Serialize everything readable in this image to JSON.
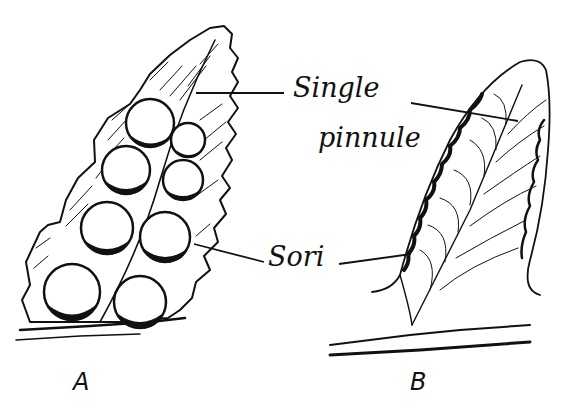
{
  "figure": {
    "type": "botanical line drawing",
    "panels": [
      {
        "id": "A",
        "label": "A",
        "description": "Pinnule underside with round sori"
      },
      {
        "id": "B",
        "label": "B",
        "description": "Single pinnule with marginal sori"
      }
    ],
    "annotations": {
      "single": "Single",
      "pinnule": "pinnule",
      "sori": "Sori"
    },
    "colors": {
      "ink": "#111111",
      "paper": "#ffffff"
    }
  }
}
